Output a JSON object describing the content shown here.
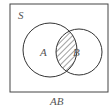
{
  "diagram": {
    "type": "venn",
    "universe_label": "S",
    "sets": [
      {
        "name": "A",
        "label": "A"
      },
      {
        "name": "B",
        "label": "B"
      }
    ],
    "shaded_region": "A∩B",
    "caption": "AB",
    "colors": {
      "stroke": "#333333",
      "text": "#555555",
      "hatch": "#444444",
      "background": "#ffffff"
    }
  }
}
